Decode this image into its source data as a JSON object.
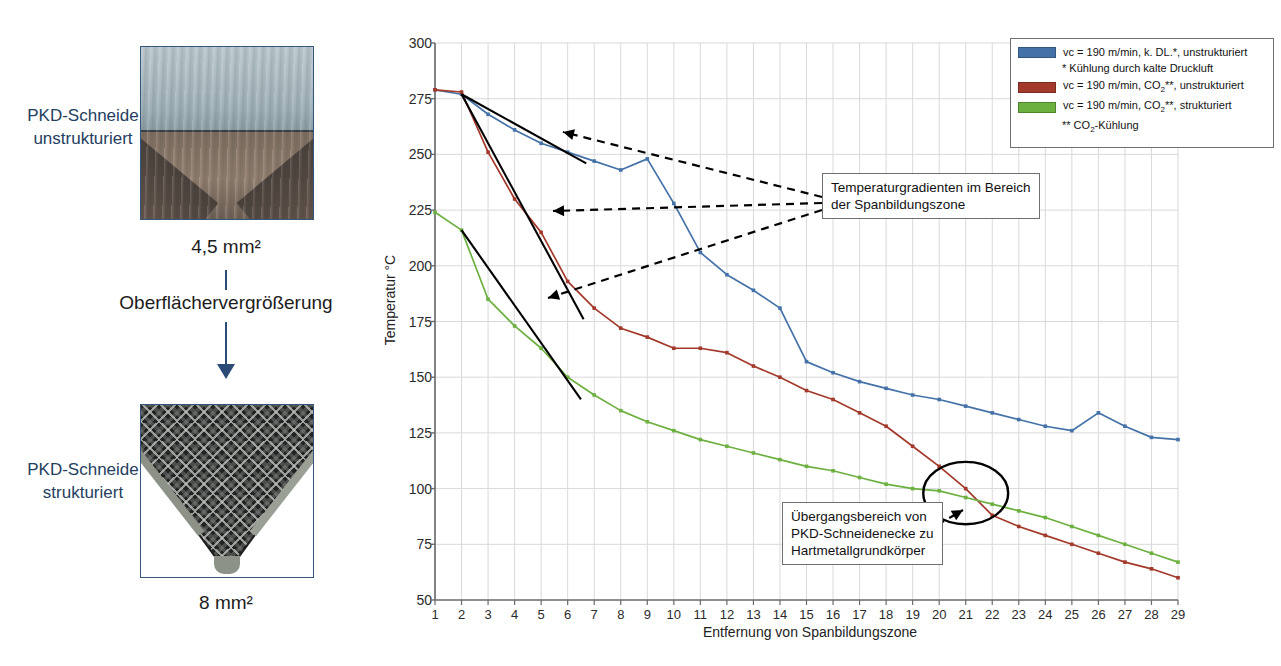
{
  "left_panel": {
    "top_caption": "PKD-Schneide unstrukturiert",
    "top_caption_line1": "PKD-Schneide",
    "top_caption_line2": "unstrukturiert",
    "top_area": "4,5 mm²",
    "transition_label": "Oberflächervergrößerung",
    "bottom_caption_line1": "PKD-Schneide",
    "bottom_caption_line2": "strukturiert",
    "bottom_area": "8 mm²"
  },
  "legend": {
    "position": "top-right",
    "entries": [
      {
        "label": "vc = 190 m/min, k. DL.*, unstrukturiert",
        "color": "#4472a8"
      },
      {
        "label": "vc = 190 m/min, CO₂**, unstrukturiert",
        "color": "#a3392a"
      },
      {
        "label": "vc = 190 m/min, CO₂**, strukturiert",
        "color": "#6cb03f"
      }
    ],
    "note_1": "* Kühlung durch kalte Druckluft",
    "note_2": "** CO₂-Kühlung"
  },
  "annotations": [
    {
      "id": "gradient-note",
      "line1": "Temperaturgradienten im Bereich",
      "line2": "der Spanbildungszone"
    },
    {
      "id": "transition-note",
      "line1": "Übergangsbereich von",
      "line2": "PKD-Schneidenecke zu",
      "line3": "Hartmetallgrundkörper"
    }
  ],
  "chart_data": {
    "type": "line",
    "title": "",
    "xlabel": "Entfernung von Spanbildungszone",
    "ylabel": "Temperatur °C",
    "xlim": [
      1,
      29
    ],
    "ylim": [
      50,
      300
    ],
    "yticks": [
      50,
      75,
      100,
      125,
      150,
      175,
      200,
      225,
      250,
      275,
      300
    ],
    "grid": true,
    "x": [
      1,
      2,
      3,
      4,
      5,
      6,
      7,
      8,
      9,
      10,
      11,
      12,
      13,
      14,
      15,
      16,
      17,
      18,
      19,
      20,
      21,
      22,
      23,
      24,
      25,
      26,
      27,
      28,
      29
    ],
    "categories": [
      "1",
      "2",
      "3",
      "4",
      "5",
      "6",
      "7",
      "8",
      "9",
      "10",
      "11",
      "12",
      "13",
      "14",
      "15",
      "16",
      "17",
      "18",
      "19",
      "20",
      "21",
      "22",
      "23",
      "24",
      "25",
      "26",
      "27",
      "28",
      "29"
    ],
    "series": [
      {
        "name": "vc = 190 m/min, k. DL.*, unstrukturiert",
        "color": "#4472a8",
        "values": [
          279,
          277,
          268,
          261,
          255,
          251,
          247,
          243,
          248,
          228,
          206,
          196,
          189,
          181,
          157,
          152,
          148,
          145,
          142,
          140,
          137,
          134,
          131,
          128,
          126,
          134,
          128,
          123,
          122
        ]
      },
      {
        "name": "vc = 190 m/min, CO₂**, unstrukturiert",
        "color": "#a3392a",
        "values": [
          279,
          278,
          251,
          230,
          215,
          193,
          181,
          172,
          168,
          163,
          163,
          161,
          155,
          150,
          144,
          140,
          134,
          128,
          119,
          110,
          100,
          88,
          83,
          79,
          75,
          71,
          67,
          64,
          60
        ]
      },
      {
        "name": "vc = 190 m/min, CO₂**, strukturiert",
        "color": "#6cb03f",
        "values": [
          224,
          216,
          185,
          173,
          163,
          150,
          142,
          135,
          130,
          126,
          122,
          119,
          116,
          113,
          110,
          108,
          105,
          102,
          100,
          99,
          96,
          93,
          90,
          87,
          83,
          79,
          75,
          71,
          67
        ]
      }
    ],
    "gradient_lines": [
      {
        "name": "gradient-blue",
        "x1": 2,
        "y1": 277,
        "x2": 6.7,
        "y2": 246
      },
      {
        "name": "gradient-red",
        "x1": 2,
        "y1": 277,
        "x2": 6.6,
        "y2": 176
      },
      {
        "name": "gradient-green",
        "x1": 2,
        "y1": 216,
        "x2": 6.5,
        "y2": 140
      }
    ],
    "highlight_ellipse": {
      "cx": 21,
      "cy": 98,
      "rx": 1.6,
      "ry": 14
    }
  }
}
